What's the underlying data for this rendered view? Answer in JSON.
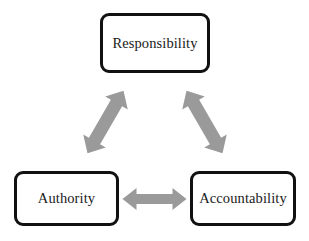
{
  "diagram": {
    "background_color": "#ffffff",
    "box_border_color": "#111111",
    "box_fill_color": "#ffffff",
    "arrow_color": "#9a9a9a",
    "nodes": [
      {
        "id": "responsibility",
        "label": "Responsibility"
      },
      {
        "id": "authority",
        "label": "Authority"
      },
      {
        "id": "accountability",
        "label": "Accountability"
      }
    ],
    "connectors": [
      {
        "id": "responsibility-authority",
        "from": "Responsibility",
        "to": "Authority",
        "style": "double-headed-arrow",
        "orientation": "diagonal-down-left"
      },
      {
        "id": "responsibility-accountability",
        "from": "Responsibility",
        "to": "Accountability",
        "style": "double-headed-arrow",
        "orientation": "diagonal-down-right"
      },
      {
        "id": "authority-accountability",
        "from": "Authority",
        "to": "Accountability",
        "style": "double-headed-arrow",
        "orientation": "horizontal"
      }
    ]
  }
}
